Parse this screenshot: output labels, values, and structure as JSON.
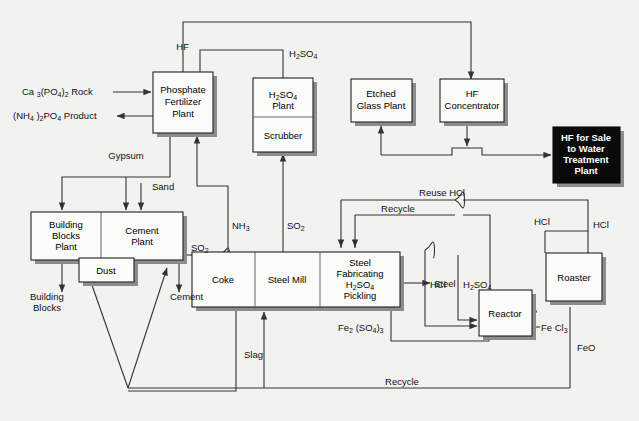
{
  "diagram": {
    "background_color": "#f2f2f0",
    "line_color": "#333333",
    "box_fill": "#fbfbfa",
    "box_stroke": "#222222",
    "shadow_color": "#8c8c8c",
    "highlight_box_fill": "#0a0a0a",
    "highlight_box_text_color": "#ffffff"
  },
  "boxes": {
    "phosphate_fertilizer_plant": {
      "line1": "Phosphate",
      "line2": "Fertilizer",
      "line3": "Plant"
    },
    "h2so4_plant": {
      "line1": "H",
      "sub1": "2",
      "line2": "SO",
      "sub2": "4",
      "line3": "Plant",
      "full": "H2SO4 Plant"
    },
    "scrubber": {
      "label": "Scrubber"
    },
    "etched_glass_plant": {
      "line1": "Etched",
      "line2": "Glass Plant"
    },
    "hf_concentrator": {
      "line1": "HF",
      "line2": "Concentrator"
    },
    "hf_for_sale": {
      "line1": "HF  for Sale",
      "line2": "to Water",
      "line3": "Treatment",
      "line4": "Plant"
    },
    "building_blocks_plant": {
      "line1": "Building",
      "line2": "Blocks",
      "line3": "Plant"
    },
    "cement_plant": {
      "line1": "Cement",
      "line2": "Plant"
    },
    "dust": {
      "label": "Dust"
    },
    "coke": {
      "label": "Coke"
    },
    "steel_mill": {
      "label": "Steel Mill"
    },
    "steel_fabricating": {
      "line1": "Steel",
      "line2": "Fabricating",
      "line3": "H2SO4",
      "line4": "Pickling"
    },
    "reactor": {
      "label": "Reactor"
    },
    "roaster": {
      "label": "Roaster"
    }
  },
  "stream_labels": {
    "hf": "HF",
    "h2so4_top": "H2SO4",
    "ca3po42_rock": "Ca 3(PO4)2 Rock",
    "nh42po4_product": "(NH4)2PO4 Product",
    "gypsum": "Gypsum",
    "sand": "Sand",
    "so2_left": "SO2",
    "so2_right": "SO2",
    "nh3": "NH3",
    "reuse_hcl": "Reuse HCl",
    "recycle_top": "Recycle",
    "hcl_right": "HCl",
    "hcl_roaster_in": "HCl",
    "hcl_reactor_in": "HCl",
    "h2so4_reactor": "H2SO4",
    "fe2so43": "Fe2 (SO4)3",
    "fecl3": "Fe Cl3",
    "feo": "FeO",
    "steel_out": "Steel",
    "slag": "Slag",
    "cement_out": "Cement",
    "building_blocks_out": "Building Blocks",
    "recycle_bottom": "Recycle"
  }
}
